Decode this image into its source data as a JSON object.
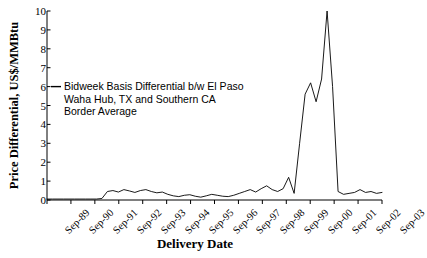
{
  "chart_data": {
    "type": "line",
    "title": "",
    "xlabel": "Delivery Date",
    "ylabel": "Price Differential, US$/MMBtu",
    "ylim": [
      0,
      10
    ],
    "yticks": [
      0,
      1,
      2,
      3,
      4,
      5,
      6,
      7,
      8,
      9,
      10
    ],
    "grid": false,
    "legend_position": "inside-upper-left",
    "legend": [
      "Bidweek Basis Differential b/w El Paso Waha Hub, TX and Southern CA Border Average"
    ],
    "series": [
      {
        "name": "Bidweek Basis Differential b/w El Paso Waha Hub, TX and Southern CA Border Average",
        "color": "#000000",
        "x": [
          "Sep-89",
          "Dec-89",
          "Mar-90",
          "Jun-90",
          "Sep-90",
          "Dec-90",
          "Mar-91",
          "Jun-91",
          "Sep-91",
          "Dec-91",
          "Mar-92",
          "Jun-92",
          "Sep-92",
          "Dec-92",
          "Mar-93",
          "Jun-93",
          "Sep-93",
          "Dec-93",
          "Mar-94",
          "Jun-94",
          "Sep-94",
          "Dec-94",
          "Mar-95",
          "Jun-95",
          "Sep-95",
          "Dec-95",
          "Mar-96",
          "Jun-96",
          "Sep-96",
          "Dec-96",
          "Mar-97",
          "Jun-97",
          "Sep-97",
          "Dec-97",
          "Mar-98",
          "Jun-98",
          "Sep-98",
          "Dec-98",
          "Mar-99",
          "Jun-99",
          "Sep-99",
          "Dec-99",
          "Mar-00",
          "Jun-00",
          "Sep-00",
          "Nov-00",
          "Dec-00",
          "Jan-01",
          "Feb-01",
          "Mar-01",
          "Apr-01",
          "May-01",
          "Jun-01",
          "Sep-01",
          "Dec-01",
          "Mar-02",
          "Jun-02",
          "Sep-02",
          "Dec-02",
          "Mar-03",
          "Jun-03",
          "Sep-03"
        ],
        "values": [
          0.05,
          0.05,
          0.05,
          0.05,
          0.05,
          0.05,
          0.05,
          0.05,
          0.05,
          0.05,
          0.08,
          0.45,
          0.5,
          0.42,
          0.55,
          0.48,
          0.4,
          0.5,
          0.55,
          0.45,
          0.38,
          0.42,
          0.3,
          0.22,
          0.18,
          0.25,
          0.28,
          0.2,
          0.15,
          0.22,
          0.3,
          0.25,
          0.2,
          0.18,
          0.25,
          0.35,
          0.45,
          0.55,
          0.42,
          0.6,
          0.75,
          0.55,
          0.45,
          0.6,
          1.2,
          0.35,
          3.0,
          5.6,
          6.2,
          5.2,
          6.4,
          10.0,
          6.0,
          0.45,
          0.3,
          0.35,
          0.4,
          0.55,
          0.4,
          0.45,
          0.35,
          0.4
        ]
      }
    ]
  },
  "axis": {
    "y_ticks": [
      "0",
      "1",
      "2",
      "3",
      "4",
      "5",
      "6",
      "7",
      "8",
      "9",
      "10"
    ],
    "x_ticks": [
      "Sep-89",
      "Sep-90",
      "Sep-91",
      "Sep-92",
      "Sep-93",
      "Sep-94",
      "Sep-95",
      "Sep-96",
      "Sep-97",
      "Sep-98",
      "Sep-99",
      "Sep-00",
      "Sep-01",
      "Sep-02",
      "Sep-03"
    ],
    "y_title": "Price Differential, US$/MMBtu",
    "x_title": "Delivery Date"
  },
  "legend": {
    "line1": "Bidweek Basis Differential b/w El Paso",
    "line2": "Waha Hub, TX and Southern CA",
    "line3": "Border Average"
  }
}
